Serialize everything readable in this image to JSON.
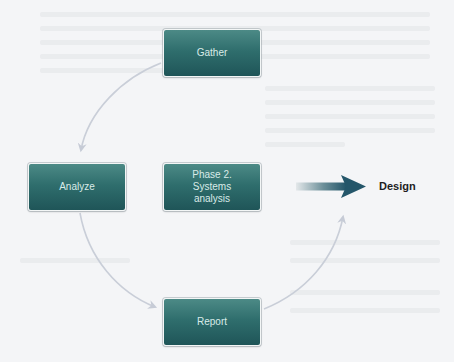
{
  "diagram": {
    "type": "cycle",
    "nodes": [
      {
        "id": "gather",
        "label": "Gather"
      },
      {
        "id": "analyze",
        "label": "Analyze"
      },
      {
        "id": "center",
        "label_lines": [
          "Phase 2.",
          "Systems",
          "analysis"
        ]
      },
      {
        "id": "report",
        "label": "Report"
      }
    ],
    "edges": [
      {
        "from": "gather",
        "to": "analyze"
      },
      {
        "from": "analyze",
        "to": "report"
      },
      {
        "from": "report",
        "to": "gather"
      }
    ],
    "output": {
      "label": "Design",
      "arrow": "gradient-right-arrow"
    },
    "colors": {
      "box_top": "#4c8a86",
      "box_bottom": "#1f5558",
      "box_text": "#d9ebe8",
      "connector": "#c9ced8",
      "arrow_start": "#dfe3e6",
      "arrow_end": "#24566a",
      "label": "#1e1e1e",
      "background": "#f4f5f7"
    }
  }
}
